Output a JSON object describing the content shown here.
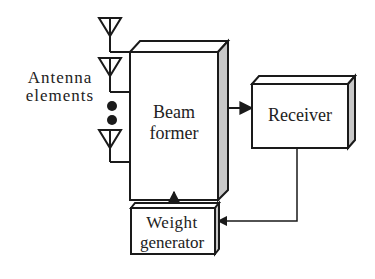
{
  "diagram": {
    "title": "",
    "colors": {
      "stroke": "#1a1a1a",
      "side_shade": "#c8c8c8",
      "top_shade": "#ffffff",
      "text": "#222222"
    },
    "labels": {
      "antenna_line1": "Antenna",
      "antenna_line2": "elements",
      "beamformer_line1": "Beam",
      "beamformer_line2": "former",
      "receiver": "Receiver",
      "weight_line1": "Weight",
      "weight_line2": "generator"
    },
    "nodes": [
      {
        "id": "antenna-elements",
        "label": "Antenna elements",
        "count_shown": 3,
        "ellipsis": "two dots"
      },
      {
        "id": "beam-former",
        "label": "Beam former"
      },
      {
        "id": "receiver",
        "label": "Receiver"
      },
      {
        "id": "weight-generator",
        "label": "Weight generator"
      }
    ],
    "edges": [
      {
        "from": "antenna-elements",
        "to": "beam-former",
        "arrow": false
      },
      {
        "from": "beam-former",
        "to": "receiver",
        "arrow": true
      },
      {
        "from": "receiver",
        "to": "weight-generator",
        "arrow": true
      },
      {
        "from": "weight-generator",
        "to": "beam-former",
        "arrow": true
      }
    ]
  }
}
